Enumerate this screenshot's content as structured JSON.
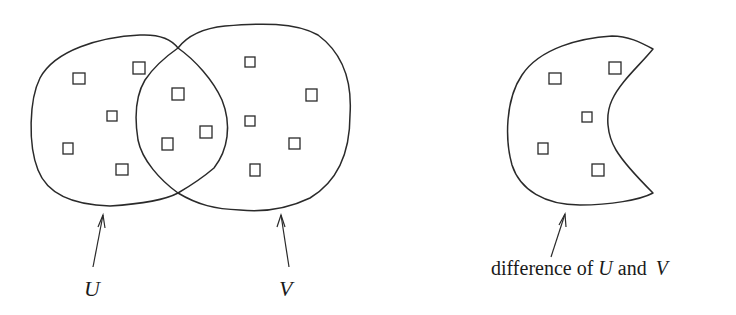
{
  "diagram": {
    "labels": {
      "set_u": "U",
      "set_v": "V",
      "caption_prefix": "difference of ",
      "caption_u": "U",
      "caption_mid": " and ",
      "caption_v": "V"
    },
    "sets": [
      {
        "name": "U",
        "element_count": 8
      },
      {
        "name": "V",
        "element_count": 9
      },
      {
        "name": "difference of U and V",
        "element_count": 5
      }
    ],
    "shared_elements_in_intersection": 4,
    "colors": {
      "stroke": "#2a2a2a",
      "background": "#ffffff",
      "text": "#1a1a1a"
    }
  }
}
